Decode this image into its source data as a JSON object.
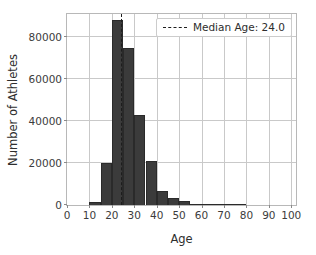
{
  "chart_data": {
    "type": "bar",
    "title": "",
    "subtitle": "",
    "xlabel": "Age",
    "ylabel": "Number of Athletes",
    "xlim": [
      0,
      103
    ],
    "ylim": [
      0,
      92000
    ],
    "xticks": [
      0,
      10,
      20,
      30,
      40,
      50,
      60,
      70,
      80,
      90,
      100
    ],
    "xtick_labels": [
      "0",
      "10",
      "20",
      "30",
      "40",
      "50",
      "60",
      "70",
      "80",
      "90",
      "100"
    ],
    "yticks": [
      0,
      20000,
      40000,
      60000,
      80000
    ],
    "ytick_labels": [
      "0",
      "20000",
      "40000",
      "60000",
      "80000"
    ],
    "grid": true,
    "grid_axis": "both",
    "bin_width": 5,
    "bar_color": "#3b3b3b",
    "bar_edge_color": "#2a2a2a",
    "bins": [
      {
        "start": 10,
        "end": 15,
        "value": 1200
      },
      {
        "start": 15,
        "end": 20,
        "value": 20000
      },
      {
        "start": 20,
        "end": 25,
        "value": 88000
      },
      {
        "start": 25,
        "end": 30,
        "value": 75000
      },
      {
        "start": 30,
        "end": 35,
        "value": 43000
      },
      {
        "start": 35,
        "end": 40,
        "value": 21000
      },
      {
        "start": 40,
        "end": 45,
        "value": 6500
      },
      {
        "start": 45,
        "end": 50,
        "value": 3400
      },
      {
        "start": 50,
        "end": 55,
        "value": 2000
      },
      {
        "start": 55,
        "end": 60,
        "value": 500
      },
      {
        "start": 60,
        "end": 65,
        "value": 150
      },
      {
        "start": 65,
        "end": 70,
        "value": 60
      },
      {
        "start": 70,
        "end": 75,
        "value": 30
      },
      {
        "start": 75,
        "end": 80,
        "value": 15
      }
    ],
    "annotations": [
      {
        "kind": "vertical-line",
        "name": "median-line",
        "x": 24.0,
        "style": "dashed",
        "color": "#1d1d1d",
        "legend_label": "Median Age: 24.0"
      }
    ],
    "legend": {
      "position": "upper right",
      "entries": [
        {
          "label": "Median Age: 24.0",
          "marker": "dashed-line",
          "color": "#1d1d1d"
        }
      ]
    }
  }
}
